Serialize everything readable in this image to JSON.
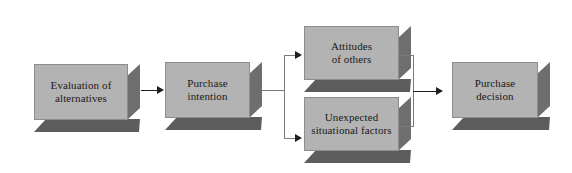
{
  "diagram": {
    "background_color": "#ffffff",
    "box_face_color": "#b3b3b3",
    "box_shadow_color": "#5d5d5d",
    "box_side_color": "#6e6e6e",
    "connector_color": "#7a7a7a",
    "arrow_color": "#1f1f1f",
    "nodes": [
      {
        "id": "evaluation-of-alternatives",
        "label": "Evaluation of\nalternatives",
        "x": 34,
        "y": 64,
        "w": 106,
        "h": 68
      },
      {
        "id": "purchase-intention",
        "label": "Purchase\nintention",
        "x": 165,
        "y": 62,
        "w": 97,
        "h": 68
      },
      {
        "id": "attitudes-of-others",
        "label": "Attitudes\nof others",
        "x": 304,
        "y": 26,
        "w": 107,
        "h": 66
      },
      {
        "id": "unexpected-situational-factors",
        "label": "Unexpected\nsituational factors",
        "x": 304,
        "y": 97,
        "w": 107,
        "h": 66
      },
      {
        "id": "purchase-decision",
        "label": "Purchase\ndecision",
        "x": 452,
        "y": 62,
        "w": 98,
        "h": 68
      }
    ],
    "edges": [
      {
        "id": "edge-evaluation-to-intention",
        "from": "evaluation-of-alternatives",
        "to": "purchase-intention"
      },
      {
        "id": "edge-intention-to-attitudes",
        "from": "purchase-intention",
        "to": "attitudes-of-others"
      },
      {
        "id": "edge-intention-to-unexpected",
        "from": "purchase-intention",
        "to": "unexpected-situational-factors"
      },
      {
        "id": "edge-attitudes-to-decision",
        "from": "attitudes-of-others",
        "to": "purchase-decision"
      },
      {
        "id": "edge-unexpected-to-decision",
        "from": "unexpected-situational-factors",
        "to": "purchase-decision"
      }
    ]
  }
}
